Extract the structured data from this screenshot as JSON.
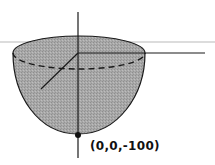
{
  "diagram": {
    "type": "3d-surface-sketch",
    "shape": "paraboloid-bowl",
    "point_label": "(0,0,-100)",
    "colors": {
      "fill": "#a6a6a6",
      "stroke": "#1a1a1a",
      "guide_line": "#dcdcdc",
      "background": "#ffffff"
    },
    "axes": [
      "z-axis",
      "x-axis",
      "y-axis"
    ]
  }
}
